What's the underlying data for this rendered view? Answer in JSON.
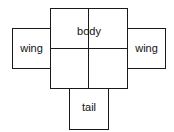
{
  "diagram": {
    "type": "net-layout",
    "parts": {
      "body": {
        "label": "body"
      },
      "left_wing": {
        "label": "wing"
      },
      "right_wing": {
        "label": "wing"
      },
      "tail": {
        "label": "tail"
      }
    },
    "colors": {
      "stroke": "#1a1a1a",
      "fill": "#ffffff",
      "text": "#111111"
    }
  }
}
